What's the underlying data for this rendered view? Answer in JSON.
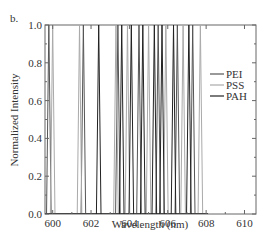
{
  "chart_data": {
    "type": "line",
    "panel_label": "b.",
    "title": "",
    "xlabel": "Wavelength (nm)",
    "ylabel": "Normalized Intensity",
    "xlim": [
      599.6,
      610.6
    ],
    "ylim": [
      0.0,
      1.0
    ],
    "x_ticks": [
      600,
      602,
      604,
      606,
      608,
      610
    ],
    "x_tick_labels": [
      "600",
      "602",
      "604",
      "606",
      "608",
      "610"
    ],
    "y_ticks": [
      0.0,
      0.2,
      0.4,
      0.6,
      0.8,
      1.0
    ],
    "y_tick_labels": [
      "0.0",
      "0.2",
      "0.4",
      "0.6",
      "0.8",
      "1.0"
    ],
    "grid": false,
    "legend_position": "center-right",
    "peak_half_width_nm": 0.12,
    "series": [
      {
        "name": "PEI",
        "color": "#555555",
        "peaks": [
          599.8,
          601.6,
          603.4,
          604.5,
          605.5,
          606.5,
          607.3
        ]
      },
      {
        "name": "PSS",
        "color": "#aaaaaa",
        "peaks": [
          600.0,
          601.4,
          603.3,
          603.9,
          605.0,
          605.9,
          606.8,
          607.7
        ]
      },
      {
        "name": "PAH",
        "color": "#222222",
        "peaks": [
          602.4,
          603.6,
          604.1,
          604.7,
          605.3,
          605.7,
          606.3,
          607.1
        ]
      }
    ]
  }
}
